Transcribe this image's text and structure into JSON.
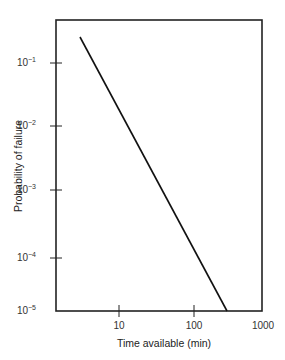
{
  "chart_data": {
    "type": "line",
    "title": "",
    "xlabel": "Time available (min)",
    "ylabel": "Probability of failure",
    "x_scale": "log",
    "y_scale": "log",
    "xlim": [
      1.5,
      1000
    ],
    "ylim": [
      1e-05,
      0.5
    ],
    "grid": false,
    "legend": null,
    "x_ticks": [
      {
        "value": 10,
        "label": "10"
      },
      {
        "value": 100,
        "label": "100"
      },
      {
        "value": 1000,
        "label": "1000"
      }
    ],
    "y_ticks": [
      {
        "value": 0.1,
        "base": "10",
        "exp": "−1"
      },
      {
        "value": 0.01,
        "base": "10",
        "exp": "−2"
      },
      {
        "value": 0.001,
        "base": "10",
        "exp": "−3"
      },
      {
        "value": 0.0001,
        "base": "10",
        "exp": "−4"
      },
      {
        "value": 1e-05,
        "base": "10",
        "exp": "−5"
      }
    ],
    "series": [
      {
        "name": "Probability of failure vs time available",
        "x": [
          3,
          280
        ],
        "y": [
          0.26,
          1e-05
        ],
        "color": "#111111"
      }
    ]
  },
  "layout": {
    "frame": {
      "left": 56,
      "top": 20,
      "right": 262,
      "bottom": 311
    },
    "x_tick_px": [
      119,
      194,
      263
    ],
    "y_tick_px": [
      63,
      126,
      190,
      258,
      311
    ],
    "line_px": {
      "x1": 80,
      "y1": 37,
      "x2": 227,
      "y2": 311
    }
  }
}
